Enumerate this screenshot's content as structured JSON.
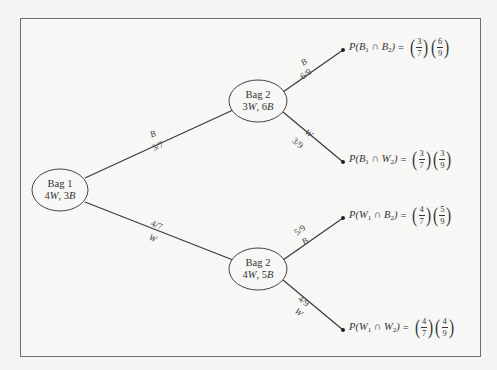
{
  "diagram": {
    "type": "probability-tree",
    "frame": {
      "border_color": "#6e6e6e",
      "background": "#f7f7f5"
    },
    "nodes": [
      {
        "id": "bag1",
        "label": "Bag 1",
        "contents": "4W, 3B",
        "contents_parts": [
          "4",
          "W",
          ", 3",
          "B"
        ]
      },
      {
        "id": "bag2-upper",
        "label": "Bag 2",
        "contents": "3W, 6B",
        "contents_parts": [
          "3",
          "W",
          ", 6",
          "B"
        ]
      },
      {
        "id": "bag2-lower",
        "label": "Bag 2",
        "contents": "4W, 5B",
        "contents_parts": [
          "4",
          "W",
          ", 5",
          "B"
        ]
      }
    ],
    "edges": [
      {
        "from": "bag1",
        "to": "bag2-upper",
        "color_label": "B",
        "probability": "3/7"
      },
      {
        "from": "bag1",
        "to": "bag2-lower",
        "color_label": "W",
        "probability": "4/7"
      },
      {
        "from": "bag2-upper",
        "to": "leaf1",
        "color_label": "B",
        "probability": "6/9"
      },
      {
        "from": "bag2-upper",
        "to": "leaf2",
        "color_label": "W",
        "probability": "3/9"
      },
      {
        "from": "bag2-lower",
        "to": "leaf3",
        "color_label": "B",
        "probability": "5/9"
      },
      {
        "from": "bag2-lower",
        "to": "leaf4",
        "color_label": "W",
        "probability": "4/9"
      }
    ],
    "leaves": [
      {
        "id": "leaf1",
        "event": "P(B₁ ∩ B₂)",
        "p_open": "P(",
        "a": "B",
        "a_sub": "1",
        "cap": " ∩ ",
        "b": "B",
        "b_sub": "2",
        "p_close": ")",
        "eq": "=",
        "f1_num": "3",
        "f1_den": "7",
        "f2_num": "6",
        "f2_den": "9"
      },
      {
        "id": "leaf2",
        "event": "P(B₁ ∩ W₂)",
        "p_open": "P(",
        "a": "B",
        "a_sub": "1",
        "cap": " ∩ ",
        "b": "W",
        "b_sub": "2",
        "p_close": ")",
        "eq": "=",
        "f1_num": "3",
        "f1_den": "7",
        "f2_num": "3",
        "f2_den": "9"
      },
      {
        "id": "leaf3",
        "event": "P(W₁ ∩ B₂)",
        "p_open": "P(",
        "a": "W",
        "a_sub": "1",
        "cap": " ∩ ",
        "b": "B",
        "b_sub": "2",
        "p_close": ")",
        "eq": "=",
        "f1_num": "4",
        "f1_den": "7",
        "f2_num": "5",
        "f2_den": "9"
      },
      {
        "id": "leaf4",
        "event": "P(W₁ ∩ W₂)",
        "p_open": "P(",
        "a": "W",
        "a_sub": "1",
        "cap": " ∩ ",
        "b": "W",
        "b_sub": "2",
        "p_close": ")",
        "eq": "=",
        "f1_num": "4",
        "f1_den": "7",
        "f2_num": "4",
        "f2_den": "9"
      }
    ],
    "paren_open": "(",
    "paren_close": ")"
  }
}
